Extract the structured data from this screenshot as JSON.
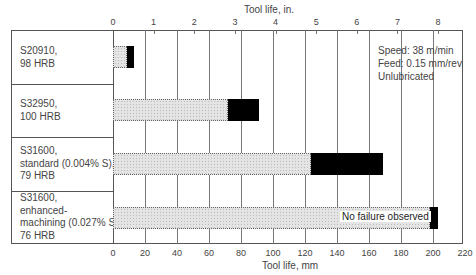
{
  "chart_data": {
    "type": "bar",
    "orientation": "horizontal",
    "stacked": true,
    "title": "",
    "xlabel": "Tool life, mm",
    "x2label": "Tool life, in.",
    "xlim": [
      0,
      220
    ],
    "x_ticks": [
      0,
      20,
      40,
      60,
      80,
      100,
      120,
      140,
      160,
      180,
      200,
      220
    ],
    "x2lim_in": [
      0,
      8.66
    ],
    "x2_ticks": [
      0,
      1,
      2,
      3,
      4,
      5,
      6,
      7,
      8
    ],
    "categories": [
      "S20910,\n98 HRB",
      "S32950,\n100 HRB",
      "S31600,\nstandard (0.004% S),\n79 HRB",
      "S31600,\nenhanced-\nmachining (0.027% S),\n76 HRB"
    ],
    "series": [
      {
        "name": "Tool life (hatched segment)",
        "color": "#e0e0e0",
        "values": [
          9,
          72,
          124,
          198
        ]
      },
      {
        "name": "Tool life range (black segment)",
        "color": "#000000",
        "values": [
          4,
          19,
          45,
          5
        ]
      }
    ],
    "totals": [
      13,
      91,
      169,
      203
    ],
    "annotations": [
      "Speed: 38 m/min",
      "Feed: 0.15 mm/rev",
      "Unlubricated",
      "No failure observed"
    ],
    "grid": true,
    "legend": null
  },
  "axis": {
    "top_title": "Tool life, in.",
    "bottom_title": "Tool life, mm",
    "mm_ticks": [
      "0",
      "20",
      "40",
      "60",
      "80",
      "100",
      "120",
      "140",
      "160",
      "180",
      "200",
      "220"
    ],
    "in_ticks": [
      "0",
      "1",
      "2",
      "3",
      "4",
      "5",
      "6",
      "7",
      "8"
    ]
  },
  "rows": [
    {
      "label": "S20910,\n98 HRB"
    },
    {
      "label": "S32950,\n100 HRB"
    },
    {
      "label": "S31600,\nstandard (0.004% S),\n79 HRB"
    },
    {
      "label": "S31600,\nenhanced-\nmachining (0.027% S),\n76 HRB"
    }
  ],
  "notes": {
    "speed": "Speed: 38 m/min",
    "feed": "Feed: 0.15 mm/rev",
    "lube": "Unlubricated",
    "no_failure": "No failure observed"
  }
}
